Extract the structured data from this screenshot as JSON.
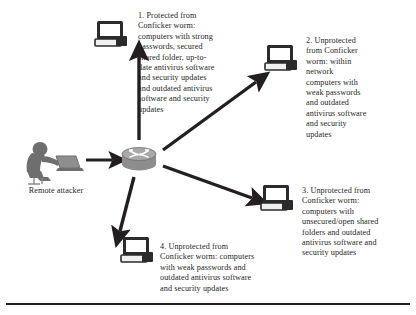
{
  "figure": {
    "accent_color": "#231f20",
    "icon_fill": "#6e6e6e",
    "background": "#ffffff"
  },
  "attacker": {
    "label": "Remote attacker",
    "icon": "person-at-laptop-icon"
  },
  "router": {
    "icon": "router-icon"
  },
  "nodes": [
    {
      "id": 1,
      "icon": "desktop-computer-icon",
      "label": "protected-computer"
    },
    {
      "id": 2,
      "icon": "desktop-computer-icon",
      "label": "unprotected-computer-weak-passwords"
    },
    {
      "id": 3,
      "icon": "desktop-computer-icon",
      "label": "unprotected-computer-open-shares"
    },
    {
      "id": 4,
      "icon": "desktop-computer-icon",
      "label": "unprotected-computer-weak-passwords-2"
    }
  ],
  "captions": {
    "one": "1. Protected from Conficker worm: computers with strong passwords, secured shared folder, up-to-date antivirus software and security updates and outdated antivirus software and security updates",
    "two": "2. Unprotected from Conficker worm: within network computers with weak passwords and outdated antivirus software and security updates",
    "three": "3. Unprotected from Conficker worm: computers with unsecured/open shared folders and outdated antivirus software and security updates",
    "four": "4. Unprotected from Conficker worm: computers with weak passwords and outdated antivirus software and security updates"
  },
  "arrows": [
    {
      "from": "attacker",
      "to": "router",
      "name": "arrow-attacker-to-router"
    },
    {
      "from": "router",
      "to": "node-1",
      "name": "arrow-router-to-node-1"
    },
    {
      "from": "router",
      "to": "node-2",
      "name": "arrow-router-to-node-2"
    },
    {
      "from": "router",
      "to": "node-3",
      "name": "arrow-router-to-node-3"
    },
    {
      "from": "router",
      "to": "node-4",
      "name": "arrow-router-to-node-4"
    }
  ]
}
